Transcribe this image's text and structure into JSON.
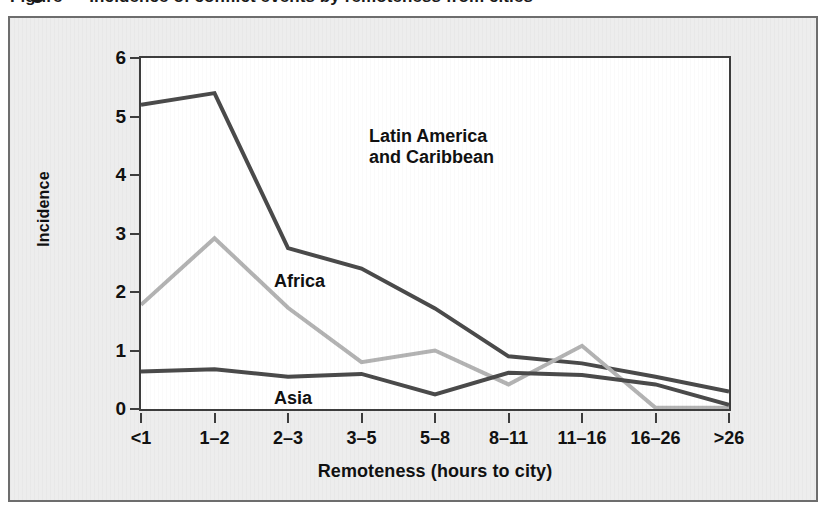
{
  "figure": {
    "title": "Figure — Incidence of conflict events by remoteness from cities",
    "panel_background": "#ededed",
    "plot_background": "#ffffff",
    "frame_color": "#3d3d3d"
  },
  "chart_data": {
    "type": "line",
    "title": "",
    "xlabel": "Remoteness (hours to city)",
    "ylabel": "Incidence",
    "categories": [
      "<1",
      "1–2",
      "2–3",
      "3–5",
      "5–8",
      "8–11",
      "11–16",
      "16–26",
      ">26"
    ],
    "ylim": [
      0,
      6
    ],
    "xlim": [
      0,
      8
    ],
    "y_ticks": [
      0,
      1,
      2,
      3,
      4,
      5,
      6
    ],
    "grid": false,
    "legend": "in-plot annotations",
    "series": [
      {
        "name": "Latin America and Caribbean",
        "color": "#4a4a4a",
        "label_text": "Latin America\nand Caribbean",
        "values": [
          5.2,
          5.4,
          2.75,
          2.4,
          1.72,
          0.9,
          0.78,
          0.55,
          0.3
        ]
      },
      {
        "name": "Africa",
        "color": "#b3b3b3",
        "label_text": "Africa",
        "values": [
          1.78,
          2.92,
          1.73,
          0.8,
          1.0,
          0.42,
          1.08,
          0.02,
          0.02
        ]
      },
      {
        "name": "Asia",
        "color": "#4a4a4a",
        "label_text": "Asia",
        "values": [
          0.64,
          0.68,
          0.55,
          0.6,
          0.25,
          0.62,
          0.58,
          0.42,
          0.07
        ]
      }
    ]
  }
}
